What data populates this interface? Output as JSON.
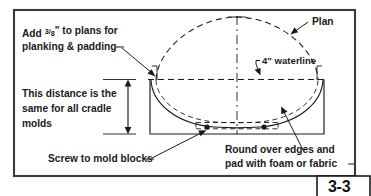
{
  "figure": {
    "id": "boat-cradle-mold-cross-section",
    "page_badge": "3-3",
    "annotations": {
      "add_plans_line1": "Add 3/8\" to plans for",
      "add_plans_line1_prefix": "Add ",
      "add_plans_fraction_numerator": "3",
      "add_plans_fraction_denominator": "8",
      "add_plans_line1_suffix": "\" to plans for",
      "add_plans_line2": "planking & padding",
      "distance_line1": "This distance is the",
      "distance_line2": "same for all cradle",
      "distance_line3": "molds",
      "screw_label": "Screw to mold blocks",
      "round_over_line1": "Round over edges and",
      "round_over_line2": "pad with foam or fabric",
      "plan_label": "Plan",
      "waterline_label": "4\" waterline"
    },
    "colors": {
      "ink": "#1a1a1a",
      "frame": "#3a3a3a",
      "background": "#ffffff"
    }
  }
}
